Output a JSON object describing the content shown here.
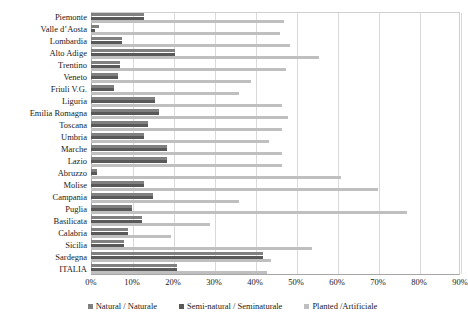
{
  "chart_data": {
    "type": "bar",
    "orientation": "horizontal",
    "title": "",
    "xlabel": "",
    "ylabel": "",
    "xlim": [
      0,
      90
    ],
    "xticks": [
      "0%",
      "10%",
      "20%",
      "30%",
      "40%",
      "50%",
      "60%",
      "70%",
      "80%",
      "90%"
    ],
    "xtick_values": [
      0,
      10,
      20,
      30,
      40,
      50,
      60,
      70,
      80,
      90
    ],
    "grid": true,
    "legend_position": "bottom",
    "categories": [
      "Piemonte",
      "Valle d’Aosta",
      "Lombardia",
      "Alto Adige",
      "Trentino",
      "Veneto",
      "Friuli V.G.",
      "Liguria",
      "Emilia Romagna",
      "Toscana",
      "Umbria",
      "Marche",
      "Lazio",
      "Abruzzo",
      "Molise",
      "Campania",
      "Puglia",
      "Basilicata",
      "Calabria",
      "Sicilia",
      "Sardegna",
      "ITALIA"
    ],
    "series": [
      {
        "name": "Natural / Naturale",
        "color": "#808080",
        "values": [
          13.0,
          2.0,
          7.5,
          20.5,
          7.0,
          6.5,
          5.5,
          15.5,
          16.5,
          14.0,
          13.0,
          18.5,
          18.5,
          1.5,
          13.0,
          15.0,
          10.0,
          12.5,
          9.0,
          8.0,
          42.0,
          21.0
        ]
      },
      {
        "name": "Semi-natural / Seminaturale",
        "color": "#595959",
        "values": [
          13.0,
          1.0,
          7.5,
          20.5,
          7.0,
          6.5,
          5.5,
          15.5,
          16.5,
          14.0,
          13.0,
          18.5,
          18.5,
          1.5,
          13.0,
          15.0,
          10.0,
          12.5,
          9.0,
          8.0,
          42.0,
          21.0
        ]
      },
      {
        "name": "Planted /Artificiale",
        "color": "#bfbfbf",
        "values": [
          47.0,
          46.0,
          48.5,
          55.5,
          47.5,
          39.0,
          36.0,
          46.5,
          48.0,
          46.5,
          43.5,
          46.5,
          46.5,
          61.0,
          70.0,
          36.0,
          77.0,
          29.0,
          19.5,
          54.0,
          44.0,
          43.0
        ]
      }
    ]
  },
  "legend": {
    "items": [
      {
        "label": "Natural / Naturale",
        "color": "#808080"
      },
      {
        "label": "Semi-natural / Seminaturale",
        "color": "#595959"
      },
      {
        "label": "Planted /Artificiale",
        "color": "#bfbfbf"
      }
    ]
  }
}
